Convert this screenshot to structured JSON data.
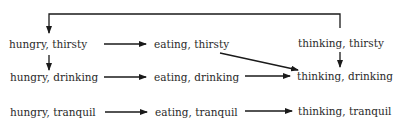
{
  "diagram": {
    "type": "state-transition",
    "nodes": [
      {
        "id": "hungry_thirsty",
        "label": "hungry, thirsty",
        "x": 9,
        "y": 38
      },
      {
        "id": "eating_thirsty",
        "label": "eating, thirsty",
        "x": 154,
        "y": 38
      },
      {
        "id": "thinking_thirsty",
        "label": "thinking, thirsty",
        "x": 298,
        "y": 37
      },
      {
        "id": "hungry_drinking",
        "label": "hungry, drinking",
        "x": 10,
        "y": 71
      },
      {
        "id": "eating_drinking",
        "label": "eating, drinking",
        "x": 154,
        "y": 71
      },
      {
        "id": "thinking_drinking",
        "label": "thinking, drinking",
        "x": 297,
        "y": 70
      },
      {
        "id": "hungry_tranquil",
        "label": "hungry, tranquil",
        "x": 10,
        "y": 106
      },
      {
        "id": "eating_tranquil",
        "label": "eating, tranquil",
        "x": 155,
        "y": 106
      },
      {
        "id": "thinking_tranquil",
        "label": "thinking, tranquil",
        "x": 298,
        "y": 105
      }
    ],
    "edges": [
      {
        "from": "hungry_thirsty",
        "to": "eating_thirsty"
      },
      {
        "from": "eating_thirsty",
        "to": "thinking_drinking"
      },
      {
        "from": "thinking_thirsty",
        "to": "thinking_drinking"
      },
      {
        "from": "thinking_thirsty",
        "to": "hungry_thirsty"
      },
      {
        "from": "hungry_thirsty",
        "to": "hungry_drinking"
      },
      {
        "from": "hungry_drinking",
        "to": "eating_drinking"
      },
      {
        "from": "eating_drinking",
        "to": "thinking_drinking"
      },
      {
        "from": "hungry_tranquil",
        "to": "eating_tranquil"
      },
      {
        "from": "eating_tranquil",
        "to": "thinking_tranquil"
      }
    ],
    "colors": {
      "line": "#1a1a1a",
      "text": "#2a2a2a",
      "background": "#ffffff"
    }
  }
}
